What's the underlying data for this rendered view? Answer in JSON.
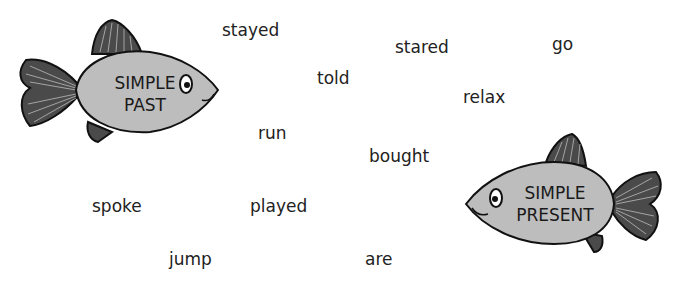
{
  "fishes": [
    {
      "id": "simple-past",
      "line1": "SIMPLE",
      "line2": "PAST"
    },
    {
      "id": "simple-present",
      "line1": "SIMPLE",
      "line2": "PRESENT"
    }
  ],
  "words": [
    {
      "text": "stayed",
      "x": 222,
      "y": 20
    },
    {
      "text": "stared",
      "x": 395,
      "y": 37
    },
    {
      "text": "go",
      "x": 552,
      "y": 36
    },
    {
      "text": "told",
      "x": 317,
      "y": 68
    },
    {
      "text": "relax",
      "x": 463,
      "y": 88
    },
    {
      "text": "run",
      "x": 258,
      "y": 123
    },
    {
      "text": "bought",
      "x": 369,
      "y": 146
    },
    {
      "text": "spoke",
      "x": 92,
      "y": 196
    },
    {
      "text": "played",
      "x": 250,
      "y": 196
    },
    {
      "text": "jump",
      "x": 169,
      "y": 249
    },
    {
      "text": "are",
      "x": 365,
      "y": 249
    }
  ],
  "colors": {
    "body": "#bdbdbd",
    "fin": "#4a4a4a",
    "outline": "#111111",
    "text": "#222222"
  }
}
